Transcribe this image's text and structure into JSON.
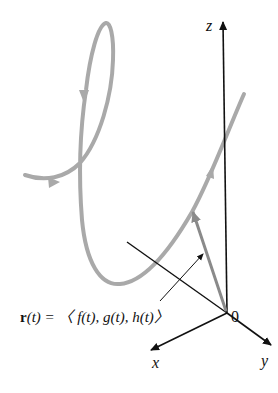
{
  "diagram": {
    "axes": {
      "z_label": "z",
      "x_label": "x",
      "y_label": "y",
      "origin_label": "0"
    },
    "equation": {
      "bold_part": "r",
      "rest": "(t) = 〈 f(t), g(t), h(t)〉"
    },
    "colors": {
      "curve": "#a9a9a9",
      "vector": "#8a8a8a",
      "axis": "#111111"
    }
  }
}
